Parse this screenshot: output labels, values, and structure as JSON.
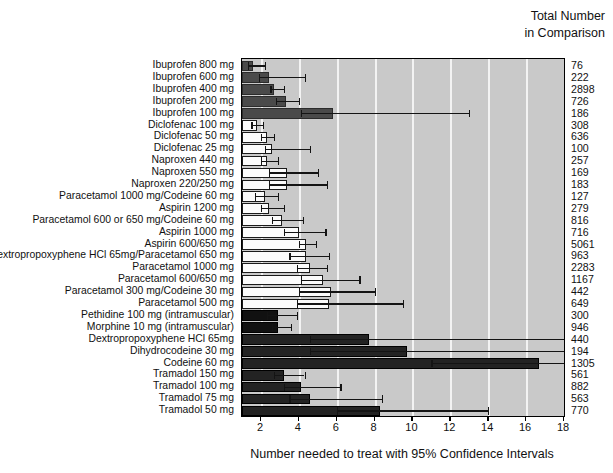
{
  "header": {
    "line1": "Total Number",
    "line2": "in Comparison"
  },
  "axis": {
    "title": "Number needed to treat with 95% Confidence Intervals"
  },
  "chart_data": {
    "type": "bar",
    "orientation": "horizontal",
    "title": "",
    "xlabel": "Number needed to treat with 95% Confidence Intervals",
    "ylabel": "",
    "xlim": [
      1,
      18
    ],
    "xticks": [
      2,
      4,
      6,
      8,
      10,
      12,
      14,
      16,
      18
    ],
    "grid": true,
    "legend": null,
    "value_label": "Number needed to treat (NNT)",
    "error_label": "95% Confidence Interval",
    "extra_column_header": "Total Number in Comparison",
    "categories": [
      "Ibuprofen 800 mg",
      "Ibuprofen 600 mg",
      "Ibuprofen 400 mg",
      "Ibuprofen 200 mg",
      "Ibuprofen 100 mg",
      "Diclofenac 100 mg",
      "Diclofenac 50 mg",
      "Diclofenac 25 mg",
      "Naproxen 440 mg",
      "Naproxen 550 mg",
      "Naproxen  220/250 mg",
      "Paracetamol 1000 mg/Codeine 60 mg",
      "Aspirin 1200 mg",
      "Paracetamol 600 or 650 mg/Codeine 60 mg",
      "Aspirin 1000 mg",
      "Aspirin 600/650 mg",
      "Dextropropoxyphene HCl 65mg/Paracetamol 650 mg",
      "Paracetamol 1000 mg",
      "Paracetamol 600/650 mg",
      "Paracetamol 300 mg/Codeine 30 mg",
      "Paracetamol 500 mg",
      "Pethidine 100 mg (intramuscular)",
      "Morphine 10 mg (intramuscular)",
      "Dextropropoxyphene HCl 65mg",
      "Dihydrocodeine 30 mg",
      "Codeine 60 mg",
      "Tramadol 150 mg",
      "Tramadol 100 mg",
      "Tramadol 75 mg",
      "Tramadol 50 mg"
    ],
    "rows": [
      {
        "label": "Ibuprofen 800 mg",
        "value": 1.6,
        "ci_low": 1.3,
        "ci_high": 2.2,
        "total": "76",
        "style": "dark"
      },
      {
        "label": "Ibuprofen 600 mg",
        "value": 2.4,
        "ci_low": 1.9,
        "ci_high": 4.3,
        "total": "222",
        "style": "dark"
      },
      {
        "label": "Ibuprofen 400 mg",
        "value": 2.7,
        "ci_low": 2.5,
        "ci_high": 3.2,
        "total": "2898",
        "style": "dark"
      },
      {
        "label": "Ibuprofen 200 mg",
        "value": 3.3,
        "ci_low": 2.8,
        "ci_high": 4.0,
        "total": "726",
        "style": "dark"
      },
      {
        "label": "Ibuprofen 100 mg",
        "value": 5.8,
        "ci_low": 4.1,
        "ci_high": 13.0,
        "total": "186",
        "style": "dark"
      },
      {
        "label": "Diclofenac 100 mg",
        "value": 1.8,
        "ci_low": 1.5,
        "ci_high": 2.1,
        "total": "308",
        "style": "white"
      },
      {
        "label": "Diclofenac 50 mg",
        "value": 2.3,
        "ci_low": 2.0,
        "ci_high": 2.7,
        "total": "636",
        "style": "white"
      },
      {
        "label": "Diclofenac 25 mg",
        "value": 2.6,
        "ci_low": 2.2,
        "ci_high": 4.6,
        "total": "100",
        "style": "white"
      },
      {
        "label": "Naproxen 440 mg",
        "value": 2.3,
        "ci_low": 2.0,
        "ci_high": 2.9,
        "total": "257",
        "style": "white"
      },
      {
        "label": "Naproxen 550 mg",
        "value": 3.4,
        "ci_low": 2.4,
        "ci_high": 5.0,
        "total": "169",
        "style": "white"
      },
      {
        "label": "Naproxen  220/250 mg",
        "value": 3.4,
        "ci_low": 2.4,
        "ci_high": 5.5,
        "total": "183",
        "style": "white"
      },
      {
        "label": "Paracetamol 1000 mg/Codeine 60 mg",
        "value": 2.2,
        "ci_low": 1.7,
        "ci_high": 2.9,
        "total": "127",
        "style": "white"
      },
      {
        "label": "Aspirin 1200 mg",
        "value": 2.4,
        "ci_low": 2.0,
        "ci_high": 3.2,
        "total": "279",
        "style": "white"
      },
      {
        "label": "Paracetamol 600 or 650 mg/Codeine 60 mg",
        "value": 3.1,
        "ci_low": 2.6,
        "ci_high": 4.2,
        "total": "816",
        "style": "white"
      },
      {
        "label": "Aspirin 1000 mg",
        "value": 4.0,
        "ci_low": 3.2,
        "ci_high": 5.4,
        "total": "716",
        "style": "white"
      },
      {
        "label": "Aspirin 600/650 mg",
        "value": 4.4,
        "ci_low": 4.0,
        "ci_high": 4.9,
        "total": "5061",
        "style": "white"
      },
      {
        "label": "Dextropropoxyphene HCl 65mg/Paracetamol 650 mg",
        "value": 4.4,
        "ci_low": 3.5,
        "ci_high": 5.6,
        "total": "963",
        "style": "white"
      },
      {
        "label": "Paracetamol 1000 mg",
        "value": 4.6,
        "ci_low": 3.9,
        "ci_high": 5.5,
        "total": "2283",
        "style": "white"
      },
      {
        "label": "Paracetamol 600/650 mg",
        "value": 5.3,
        "ci_low": 4.1,
        "ci_high": 7.2,
        "total": "1167",
        "style": "white"
      },
      {
        "label": "Paracetamol 300 mg/Codeine 30 mg",
        "value": 5.7,
        "ci_low": 4.0,
        "ci_high": 8.0,
        "total": "442",
        "style": "white"
      },
      {
        "label": "Paracetamol 500 mg",
        "value": 5.6,
        "ci_low": 3.9,
        "ci_high": 9.5,
        "total": "649",
        "style": "white"
      },
      {
        "label": "Pethidine 100 mg (intramuscular)",
        "value": 2.9,
        "ci_low": 2.3,
        "ci_high": 3.9,
        "total": "300",
        "style": "black"
      },
      {
        "label": "Morphine 10 mg (intramuscular)",
        "value": 2.9,
        "ci_low": 2.6,
        "ci_high": 3.6,
        "total": "946",
        "style": "black"
      },
      {
        "label": "Dextropropoxyphene HCl 65mg",
        "value": 7.7,
        "ci_low": 4.6,
        "ci_high": 19.0,
        "total": "440",
        "style": "darkest"
      },
      {
        "label": "Dihydrocodeine 30 mg",
        "value": 9.7,
        "ci_low": 4.6,
        "ci_high": 19.0,
        "total": "194",
        "style": "darkest"
      },
      {
        "label": "Codeine 60 mg",
        "value": 16.7,
        "ci_low": 11.0,
        "ci_high": 19.0,
        "total": "1305",
        "style": "darkest"
      },
      {
        "label": "Tramadol 150 mg",
        "value": 3.2,
        "ci_low": 2.7,
        "ci_high": 4.3,
        "total": "561",
        "style": "darkest"
      },
      {
        "label": "Tramadol 100 mg",
        "value": 4.1,
        "ci_low": 3.2,
        "ci_high": 6.2,
        "total": "882",
        "style": "darkest"
      },
      {
        "label": "Tramadol 75 mg",
        "value": 4.6,
        "ci_low": 3.5,
        "ci_high": 8.4,
        "total": "563",
        "style": "darkest"
      },
      {
        "label": "Tramadol 50 mg",
        "value": 8.3,
        "ci_low": 6.0,
        "ci_high": 14.0,
        "total": "770",
        "style": "darkest"
      }
    ]
  }
}
